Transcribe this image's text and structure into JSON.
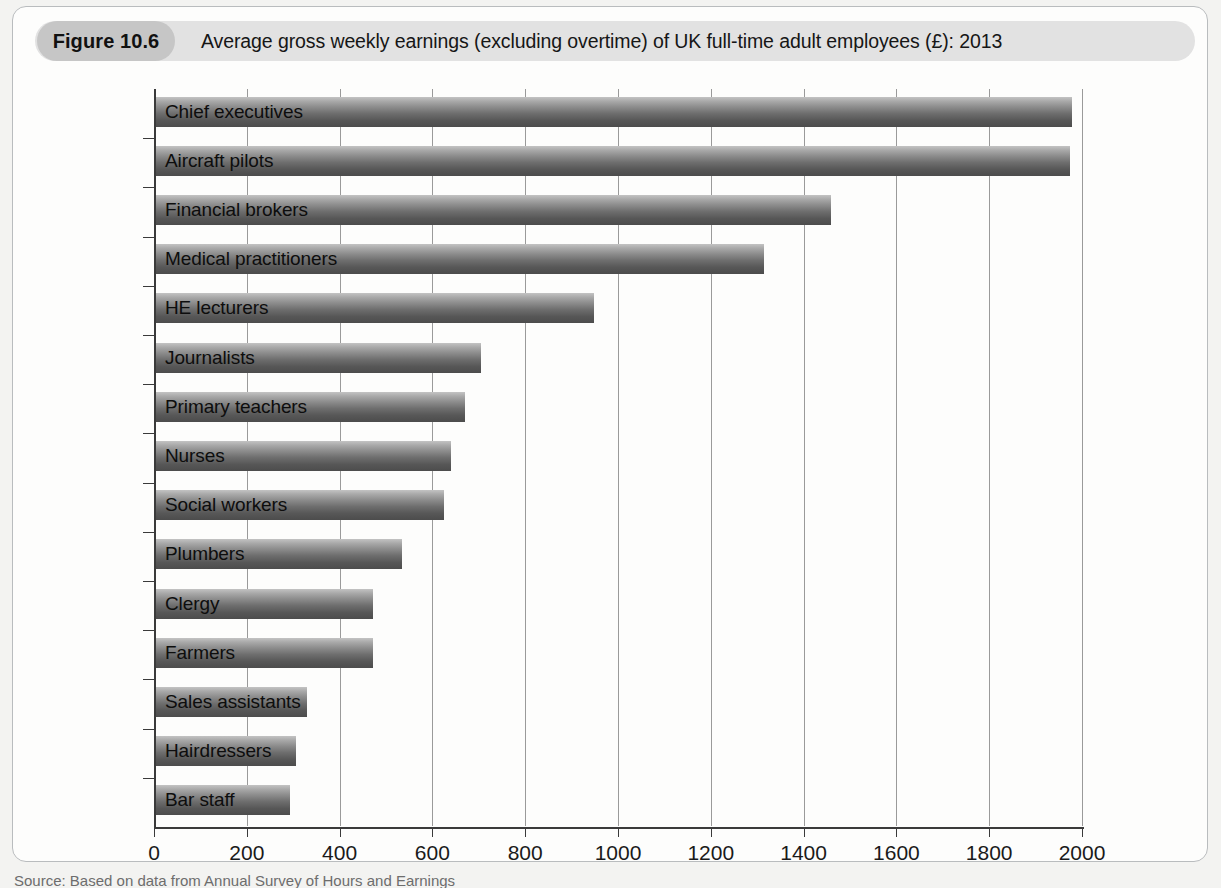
{
  "figure": {
    "number_label": "Figure 10.6",
    "caption": "Average gross weekly earnings (excluding overtime) of UK full-time adult employees (£): 2013",
    "source_note": "Source: Based on data from Annual Survey of Hours and Earnings"
  },
  "colors": {
    "caption_bar": "#e2e2e2",
    "figure_number_pill": "#c6c6c6",
    "bar_light": "#c3c3c3",
    "bar_dark": "#4c4c4c",
    "axis": "#3a3a3a",
    "gridline": "#9a9a9a",
    "frame_border": "#b9bcbe",
    "page_background": "#f3f3f1"
  },
  "chart_data": {
    "type": "bar",
    "orientation": "horizontal",
    "title": "Average gross weekly earnings (excluding overtime) of UK full-time adult employees (£): 2013",
    "xlabel": "",
    "ylabel": "",
    "xlim": [
      0,
      2000
    ],
    "xticks": [
      0,
      200,
      400,
      600,
      800,
      1000,
      1200,
      1400,
      1600,
      1800,
      2000
    ],
    "xtick_labels": [
      "0",
      "200",
      "400",
      "600",
      "800",
      "1000",
      "1200",
      "1400",
      "1600",
      "1800",
      "2000"
    ],
    "grid": true,
    "grid_axis": "x",
    "legend": false,
    "categories": [
      "Chief executives",
      "Aircraft pilots",
      "Financial brokers",
      "Medical practitioners",
      "HE lecturers",
      "Journalists",
      "Primary teachers",
      "Nurses",
      "Social workers",
      "Plumbers",
      "Clergy",
      "Farmers",
      "Sales assistants",
      "Hairdressers",
      "Bar staff"
    ],
    "values": [
      1975,
      1970,
      1455,
      1310,
      945,
      700,
      665,
      635,
      620,
      530,
      467,
      467,
      326,
      302,
      288
    ]
  }
}
